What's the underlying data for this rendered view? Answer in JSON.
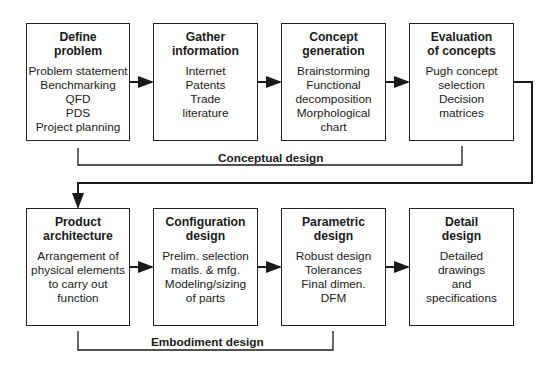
{
  "rows": [
    {
      "group_label": "Conceptual design",
      "boxes": [
        {
          "title": [
            "Define",
            "problem"
          ],
          "items": [
            "Problem statement",
            "Benchmarking",
            "QFD",
            "PDS",
            "Project planning"
          ]
        },
        {
          "title": [
            "Gather",
            "information"
          ],
          "items": [
            "Internet",
            "Patents",
            "Trade",
            "literature"
          ]
        },
        {
          "title": [
            "Concept",
            "generation"
          ],
          "items": [
            "Brainstorming",
            "Functional",
            "decomposition",
            "Morphological",
            "chart"
          ]
        },
        {
          "title": [
            "Evaluation",
            "of concepts"
          ],
          "items": [
            "Pugh concept",
            "selection",
            "Decision",
            "matrices"
          ]
        }
      ]
    },
    {
      "group_label": "Embodiment design",
      "boxes": [
        {
          "title": [
            "Product",
            "architecture"
          ],
          "items": [
            "Arrangement of",
            "physical elements",
            "to carry out",
            "function"
          ]
        },
        {
          "title": [
            "Configuration",
            "design"
          ],
          "items": [
            "Prelim. selection",
            "matls. & mfg.",
            "Modeling/sizing",
            "of parts"
          ]
        },
        {
          "title": [
            "Parametric",
            "design"
          ],
          "items": [
            "Robust design",
            "Tolerances",
            "Final dimen.",
            "DFM"
          ]
        },
        {
          "title": [
            "Detail",
            "design"
          ],
          "items": [
            "Detailed",
            "drawings",
            "and",
            "specifications"
          ]
        }
      ]
    }
  ],
  "colors": {
    "line": "#1a1a1a",
    "background": "#ffffff"
  }
}
